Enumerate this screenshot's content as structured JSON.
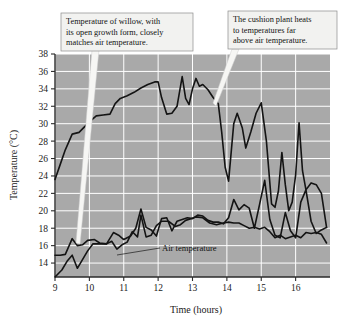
{
  "figure": {
    "background_color": "#ffffff",
    "plot_background_color": "#a9a9a9",
    "gridline_color": "#ffffff",
    "line_color": "#141414",
    "callout_fill": "#f2f2f0",
    "callout_border": "#8c8c8c"
  },
  "axes": {
    "ylabel": "Temperature (°C)",
    "xlabel": "Time (hours)",
    "y_ticks": [
      "38",
      "36",
      "34",
      "32",
      "30",
      "28",
      "26",
      "24",
      "22",
      "20",
      "18",
      "16",
      "14"
    ],
    "x_ticks": [
      "9",
      "10",
      "11",
      "12",
      "13",
      "14",
      "15",
      "16"
    ]
  },
  "annotations": {
    "callout_left": {
      "name": "willow-callout",
      "lines": [
        "Temperature of willow, with",
        "its open growth form, closely",
        "matches air temperature."
      ]
    },
    "callout_right": {
      "name": "cushion-callout",
      "lines": [
        "The cushion plant heats",
        "to temperatures far",
        "above air temperature."
      ]
    },
    "air_label": "Air temperature"
  },
  "chart_data": {
    "type": "line",
    "title": "",
    "xlabel": "Time (hours)",
    "ylabel": "Temperature (°C)",
    "xlim": [
      9,
      17
    ],
    "ylim": [
      12.4,
      38
    ],
    "x_ticks": [
      9,
      10,
      11,
      12,
      13,
      14,
      15,
      16
    ],
    "y_ticks": [
      14,
      16,
      18,
      20,
      22,
      24,
      26,
      28,
      30,
      32,
      34,
      36,
      38
    ],
    "grid": true,
    "legend": "none",
    "series": [
      {
        "name": "Cushion plant temperature",
        "x": [
          9.0,
          9.15,
          9.3,
          9.5,
          9.7,
          9.85,
          10.0,
          10.2,
          10.4,
          10.6,
          10.75,
          10.9,
          11.1,
          11.3,
          11.5,
          11.7,
          11.9,
          12.0,
          12.1,
          12.25,
          12.4,
          12.55,
          12.7,
          12.8,
          12.9,
          13.0,
          13.1,
          13.2,
          13.3,
          13.45,
          13.6,
          13.75,
          13.85,
          13.95,
          14.05,
          14.2,
          14.3,
          14.45,
          14.55,
          14.7,
          14.85,
          15.0,
          15.15,
          15.3,
          15.4,
          15.5,
          15.6,
          15.7,
          15.8,
          15.9,
          16.0,
          16.1,
          16.2,
          16.3,
          16.45,
          16.6,
          16.75,
          16.9
        ],
        "values": [
          23.6,
          25.3,
          27.0,
          28.8,
          29.0,
          29.6,
          30.2,
          30.9,
          31.0,
          31.1,
          32.3,
          32.9,
          33.2,
          33.6,
          34.1,
          34.5,
          34.8,
          34.8,
          33.0,
          31.1,
          31.2,
          32.0,
          35.4,
          32.9,
          32.2,
          34.0,
          35.2,
          34.3,
          34.5,
          33.9,
          33.0,
          32.3,
          29.0,
          25.0,
          23.4,
          30.0,
          31.2,
          29.5,
          27.2,
          29.1,
          31.2,
          32.4,
          28.0,
          20.8,
          20.4,
          22.3,
          26.7,
          23.0,
          20.0,
          21.0,
          24.1,
          30.1,
          24.6,
          22.4,
          23.2,
          23.0,
          22.0,
          18.1
        ]
      },
      {
        "name": "Willow temperature",
        "x": [
          9.0,
          9.15,
          9.3,
          9.5,
          9.65,
          9.8,
          9.95,
          10.15,
          10.3,
          10.5,
          10.7,
          10.85,
          11.0,
          11.2,
          11.35,
          11.5,
          11.65,
          11.8,
          11.95,
          12.1,
          12.25,
          12.4,
          12.55,
          12.7,
          12.85,
          13.0,
          13.15,
          13.3,
          13.45,
          13.6,
          13.75,
          13.9,
          14.05,
          14.2,
          14.35,
          14.5,
          14.65,
          14.8,
          14.95,
          15.1,
          15.25,
          15.4,
          15.55,
          15.7,
          15.85,
          16.0,
          16.15,
          16.3,
          16.45,
          16.6,
          16.75,
          16.9
        ],
        "values": [
          14.9,
          14.9,
          15.0,
          16.8,
          16.0,
          16.1,
          16.6,
          16.7,
          16.3,
          16.2,
          17.5,
          17.2,
          16.7,
          17.1,
          18.0,
          20.2,
          18.1,
          17.8,
          17.1,
          19.1,
          19.2,
          17.7,
          18.8,
          19.0,
          19.2,
          19.1,
          19.5,
          19.4,
          18.9,
          18.7,
          18.7,
          18.5,
          19.2,
          21.3,
          20.1,
          20.7,
          20.3,
          18.0,
          20.7,
          23.5,
          19.0,
          17.2,
          16.9,
          19.8,
          17.7,
          16.9,
          21.0,
          22.4,
          18.8,
          17.4,
          17.8,
          18.1
        ]
      },
      {
        "name": "Air temperature",
        "x": [
          9.0,
          9.2,
          9.35,
          9.5,
          9.65,
          9.8,
          9.95,
          10.1,
          10.3,
          10.5,
          10.65,
          10.8,
          10.95,
          11.1,
          11.25,
          11.4,
          11.5,
          11.65,
          11.8,
          11.95,
          12.1,
          12.3,
          12.5,
          12.65,
          12.8,
          12.95,
          13.1,
          13.3,
          13.5,
          13.7,
          13.9,
          14.05,
          14.2,
          14.35,
          14.5,
          14.65,
          14.8,
          14.95,
          15.1,
          15.25,
          15.4,
          15.55,
          15.7,
          15.85,
          16.0,
          16.15,
          16.3,
          16.45,
          16.6,
          16.75,
          16.9
        ],
        "values": [
          12.4,
          13.2,
          14.2,
          14.9,
          13.4,
          14.4,
          15.4,
          16.2,
          16.2,
          16.2,
          16.5,
          15.6,
          16.1,
          16.4,
          17.6,
          17.0,
          19.5,
          17.0,
          17.2,
          18.3,
          18.8,
          18.8,
          18.2,
          18.4,
          18.9,
          19.1,
          19.3,
          19.2,
          18.6,
          18.4,
          18.6,
          18.7,
          18.6,
          18.6,
          18.3,
          18.0,
          18.1,
          17.9,
          18.1,
          17.6,
          16.9,
          17.2,
          16.8,
          17.0,
          17.2,
          16.9,
          17.5,
          17.4,
          17.5,
          17.3,
          16.3
        ]
      }
    ]
  }
}
